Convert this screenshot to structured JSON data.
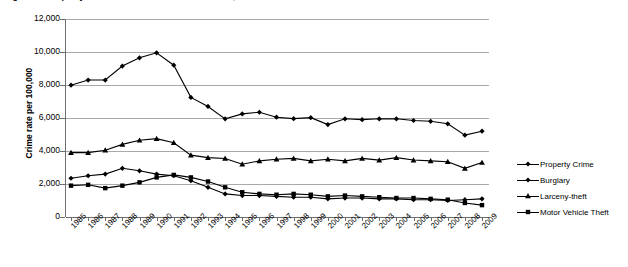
{
  "figure": {
    "title": "Figure 1. Property Crime Rates in the United States, 1985-2009",
    "source_note": "Source: FBI, Uniform Crime Reports"
  },
  "axes": {
    "y_title": "Crime rate per 100,000",
    "y_ticks": [
      "0",
      "2,000",
      "4,000",
      "6,000",
      "8,000",
      "10,000",
      "12,000"
    ],
    "x_ticks": [
      "1985",
      "1986",
      "1987",
      "1988",
      "1989",
      "1990",
      "1991",
      "1992",
      "1993",
      "1994",
      "1995",
      "1996",
      "1997",
      "1998",
      "1999",
      "2000",
      "2001",
      "2002",
      "2003",
      "2004",
      "2005",
      "2006",
      "2007",
      "2008",
      "2009"
    ]
  },
  "legend": {
    "position": "right",
    "items": [
      {
        "label": "Property Crime",
        "marker": "diamond-marker",
        "color": "#000000"
      },
      {
        "label": "Burglary",
        "marker": "diamond-marker",
        "color": "#000000"
      },
      {
        "label": "Larceny-theft",
        "marker": "triangle-marker",
        "color": "#000000"
      },
      {
        "label": "Motor Vehicle Theft",
        "marker": "square-marker",
        "color": "#000000"
      }
    ]
  },
  "chart_data": {
    "type": "line",
    "title": "Figure 1. Property Crime Rates in the United States, 1985-2009",
    "xlabel": "",
    "ylabel": "Crime rate per 100,000",
    "ylim": [
      0,
      12000
    ],
    "ytick_step": 2000,
    "grid": true,
    "legend_position": "right",
    "categories": [
      "1985",
      "1986",
      "1987",
      "1988",
      "1989",
      "1990",
      "1991",
      "1992",
      "1993",
      "1994",
      "1995",
      "1996",
      "1997",
      "1998",
      "1999",
      "2000",
      "2001",
      "2002",
      "2003",
      "2004",
      "2005",
      "2006",
      "2007",
      "2008",
      "2009"
    ],
    "series": [
      {
        "name": "Property Crime",
        "marker": "diamond",
        "values": [
          7990,
          8300,
          8300,
          9150,
          9650,
          9950,
          9200,
          7250,
          6700,
          5950,
          6250,
          6350,
          6050,
          5960,
          6020,
          5600,
          5950,
          5900,
          5950,
          5950,
          5850,
          5800,
          5650,
          4960,
          5200
        ]
      },
      {
        "name": "Burglary",
        "marker": "diamond",
        "values": [
          2350,
          2500,
          2600,
          2950,
          2800,
          2600,
          2500,
          2200,
          1800,
          1400,
          1300,
          1300,
          1250,
          1200,
          1200,
          1100,
          1150,
          1150,
          1100,
          1100,
          1050,
          1050,
          1000,
          1050,
          1100
        ]
      },
      {
        "name": "Larceny-theft",
        "marker": "triangle",
        "values": [
          3900,
          3900,
          4050,
          4400,
          4650,
          4750,
          4500,
          3750,
          3600,
          3550,
          3200,
          3400,
          3500,
          3550,
          3400,
          3500,
          3400,
          3550,
          3450,
          3600,
          3450,
          3400,
          3350,
          2950,
          3300
        ]
      },
      {
        "name": "Motor Vehicle Theft",
        "marker": "square",
        "values": [
          1900,
          1950,
          1750,
          1900,
          2100,
          2400,
          2550,
          2400,
          2150,
          1800,
          1500,
          1400,
          1350,
          1400,
          1350,
          1250,
          1300,
          1250,
          1200,
          1150,
          1150,
          1100,
          1050,
          850,
          720
        ]
      }
    ]
  }
}
